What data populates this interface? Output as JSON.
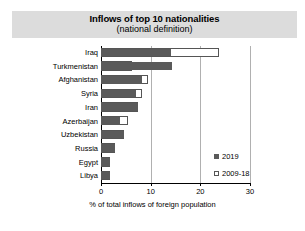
{
  "chart_data": {
    "type": "bar",
    "orientation": "horizontal",
    "title": "Inflows of top 10 nationalities",
    "subtitle": "(national definition)",
    "xlabel": "% of total inflows of foreign population",
    "ylabel": "",
    "xlim": [
      0,
      30
    ],
    "xticks": [
      0,
      10,
      20,
      30
    ],
    "xtick_labels": [
      "0",
      "10",
      "20",
      "30"
    ],
    "grid": true,
    "legend_position": "right",
    "categories": [
      "Iraq",
      "Turkmenistan",
      "Afghanistan",
      "Syria",
      "Iran",
      "Azerbaijan",
      "Uzbekistan",
      "Russia",
      "Egypt",
      "Libya"
    ],
    "series": [
      {
        "name": "2019",
        "color": "#5a5a5a",
        "values": [
          14.0,
          14.3,
          8.2,
          7.0,
          7.4,
          3.9,
          4.6,
          2.8,
          1.8,
          1.9
        ]
      },
      {
        "name": "2009-18",
        "color": "#ffffff",
        "values": [
          23.7,
          6.2,
          9.5,
          8.2,
          7.4,
          5.4,
          4.6,
          2.8,
          1.8,
          1.9
        ]
      }
    ]
  },
  "legend": {
    "items": [
      {
        "label": "2019"
      },
      {
        "label": "2009-18"
      }
    ]
  },
  "colors": {
    "title_band": "#dcdcdc",
    "series_2019": "#5a5a5a",
    "series_2009_18": "#ffffff",
    "gridline": "#b0b0b0",
    "axis": "#000000"
  }
}
